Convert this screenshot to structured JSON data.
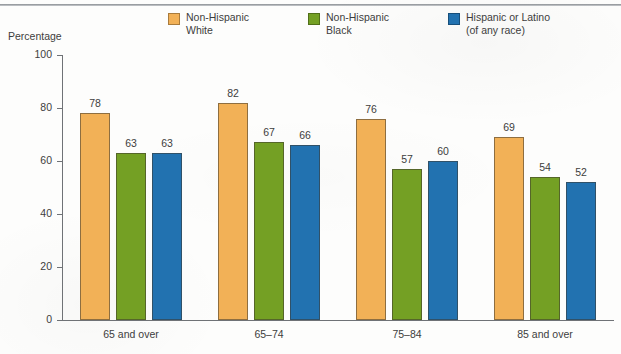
{
  "axis_title": "Percentage",
  "legend": {
    "items": [
      {
        "label_line1": "Non-Hispanic",
        "label_line2": "White",
        "color": "#F2B157",
        "swatch_name": "legend-swatch-non-hispanic-white"
      },
      {
        "label_line1": "Non-Hispanic",
        "label_line2": "Black",
        "color": "#74A024",
        "swatch_name": "legend-swatch-non-hispanic-black"
      },
      {
        "label_line1": "Hispanic or Latino",
        "label_line2": "(of any race)",
        "color": "#2272B0",
        "swatch_name": "legend-swatch-hispanic-or-latino"
      }
    ]
  },
  "chart_data": {
    "type": "bar",
    "title": "",
    "xlabel": "",
    "ylabel": "Percentage",
    "ylim": [
      0,
      100
    ],
    "yticks": [
      0,
      20,
      40,
      60,
      80,
      100
    ],
    "ytick_labels": [
      "0",
      "20",
      "40",
      "60",
      "80",
      "100"
    ],
    "grid": false,
    "legend_position": "top",
    "categories": [
      "65 and over",
      "65–74",
      "75–84",
      "85 and over"
    ],
    "series": [
      {
        "name": "Non-Hispanic White",
        "color": "#F2B157",
        "values": [
          78,
          82,
          76,
          69
        ]
      },
      {
        "name": "Non-Hispanic Black",
        "color": "#74A024",
        "values": [
          63,
          67,
          57,
          54
        ]
      },
      {
        "name": "Hispanic or Latino (of any race)",
        "color": "#2272B0",
        "values": [
          63,
          66,
          60,
          52
        ]
      }
    ]
  }
}
